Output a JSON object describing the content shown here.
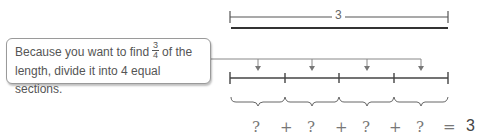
{
  "callout": {
    "line1_before": "Because you want to find",
    "fraction_numerator": "3",
    "fraction_denominator": "4",
    "line1_after": "of the",
    "line2": "length, divide it into 4 equal sections."
  },
  "top_measure": {
    "label": "3"
  },
  "equation": {
    "terms": [
      "?",
      "+",
      "?",
      "+",
      "?",
      "+",
      "?",
      "=",
      "3"
    ]
  },
  "colors": {
    "line": "#555555",
    "callout_border": "#9a9a9a",
    "text": "#555555"
  }
}
